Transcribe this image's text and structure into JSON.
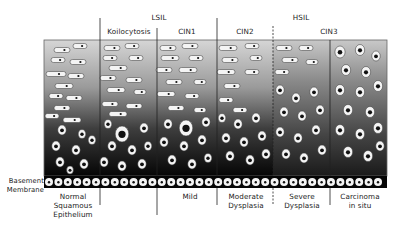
{
  "diagram": {
    "title_groups": {
      "lsil": "LSIL",
      "hsil": "HSIL"
    },
    "top_labels": {
      "koilocytosis": "Koilocytosis",
      "cin1": "CIN1",
      "cin2": "CIN2",
      "cin3": "CIN3"
    },
    "side_label": "Basement\nMembrane",
    "bottom_labels": {
      "normal": "Normal\nSquamous\nEpithelium",
      "mild": "Mild",
      "moderate": "Moderate\nDysplasia",
      "severe": "Severe\nDysplasia",
      "carcinoma": "Carcinoma\nin situ"
    },
    "colors": {
      "gradient_top": "#d4d4d4",
      "gradient_mid": "#6a6a6a",
      "gradient_bottom": "#050505",
      "cell_fill": "#f4f4f4",
      "nucleus": "#111111",
      "divider": "#222222"
    },
    "layout": {
      "box": {
        "x": 44,
        "y": 40,
        "w": 343,
        "h": 136
      },
      "membrane": {
        "y": 176,
        "h": 12
      },
      "dividers": [
        {
          "x": 100,
          "y1": 18,
          "y2": 176,
          "style": "solid",
          "bottom": [
            188,
            205
          ]
        },
        {
          "x": 157,
          "y1": 28,
          "y2": 176,
          "style": "solid",
          "bottom": [
            188,
            215
          ]
        },
        {
          "x": 217,
          "y1": 18,
          "y2": 176,
          "style": "solid",
          "bottom": [
            188,
            205
          ]
        },
        {
          "x": 273,
          "y1": 26,
          "y2": 176,
          "style": "dashed",
          "bottom": [
            188,
            205
          ]
        },
        {
          "x": 330,
          "y1": 40,
          "y2": 176,
          "style": "solid",
          "bottom": [
            188,
            205
          ]
        }
      ]
    },
    "cells": {
      "flat": [
        [
          62,
          50,
          16,
          5
        ],
        [
          80,
          46,
          14,
          5
        ],
        [
          58,
          60,
          14,
          5
        ],
        [
          78,
          62,
          16,
          5
        ],
        [
          56,
          74,
          20,
          5
        ],
        [
          76,
          76,
          16,
          5
        ],
        [
          64,
          86,
          18,
          5
        ],
        [
          56,
          96,
          14,
          5
        ],
        [
          74,
          98,
          16,
          5
        ],
        [
          62,
          108,
          16,
          5
        ],
        [
          52,
          116,
          14,
          5
        ],
        [
          72,
          120,
          18,
          5
        ],
        [
          112,
          48,
          16,
          5
        ],
        [
          132,
          46,
          14,
          5
        ],
        [
          110,
          58,
          14,
          5
        ],
        [
          136,
          58,
          14,
          5
        ],
        [
          118,
          68,
          18,
          5
        ],
        [
          108,
          78,
          16,
          5
        ],
        [
          134,
          80,
          16,
          5
        ],
        [
          116,
          90,
          18,
          5
        ],
        [
          140,
          92,
          12,
          5
        ],
        [
          110,
          104,
          16,
          5
        ],
        [
          134,
          106,
          16,
          5
        ],
        [
          118,
          114,
          18,
          5
        ],
        [
          168,
          48,
          16,
          5
        ],
        [
          190,
          46,
          16,
          5
        ],
        [
          170,
          58,
          18,
          5
        ],
        [
          196,
          58,
          14,
          5
        ],
        [
          164,
          70,
          16,
          5
        ],
        [
          188,
          70,
          18,
          5
        ],
        [
          174,
          82,
          16,
          5
        ],
        [
          200,
          82,
          12,
          5
        ],
        [
          166,
          94,
          18,
          5
        ],
        [
          192,
          96,
          14,
          5
        ],
        [
          176,
          108,
          16,
          5
        ],
        [
          200,
          110,
          12,
          5
        ],
        [
          228,
          48,
          18,
          5
        ],
        [
          252,
          46,
          14,
          5
        ],
        [
          230,
          60,
          16,
          5
        ],
        [
          256,
          58,
          12,
          5
        ],
        [
          226,
          72,
          18,
          5
        ],
        [
          252,
          72,
          14,
          5
        ],
        [
          232,
          86,
          16,
          5
        ],
        [
          226,
          100,
          14,
          5
        ],
        [
          240,
          110,
          14,
          5
        ],
        [
          284,
          48,
          16,
          5
        ],
        [
          306,
          48,
          14,
          5
        ],
        [
          290,
          60,
          16,
          5
        ],
        [
          312,
          62,
          12,
          5
        ],
        [
          282,
          72,
          14,
          5
        ]
      ],
      "round": [
        [
          62,
          130,
          5
        ],
        [
          82,
          134,
          4.5
        ],
        [
          56,
          146,
          5
        ],
        [
          76,
          150,
          5
        ],
        [
          92,
          140,
          4.5
        ],
        [
          60,
          162,
          5
        ],
        [
          84,
          164,
          5
        ],
        [
          70,
          170,
          4
        ],
        [
          108,
          124,
          4.5
        ],
        [
          122,
          134,
          8
        ],
        [
          144,
          128,
          5
        ],
        [
          112,
          146,
          5
        ],
        [
          132,
          150,
          5
        ],
        [
          148,
          146,
          4.5
        ],
        [
          104,
          162,
          5
        ],
        [
          122,
          166,
          5
        ],
        [
          142,
          164,
          5
        ],
        [
          168,
          124,
          5
        ],
        [
          186,
          128,
          8
        ],
        [
          206,
          122,
          5
        ],
        [
          164,
          142,
          5
        ],
        [
          184,
          146,
          5
        ],
        [
          202,
          140,
          5
        ],
        [
          172,
          160,
          5
        ],
        [
          192,
          164,
          5
        ],
        [
          208,
          158,
          4.5
        ],
        [
          222,
          118,
          4.5
        ],
        [
          238,
          124,
          5
        ],
        [
          256,
          118,
          5
        ],
        [
          226,
          138,
          5
        ],
        [
          244,
          142,
          5
        ],
        [
          262,
          136,
          5
        ],
        [
          230,
          156,
          5
        ],
        [
          250,
          160,
          5
        ],
        [
          266,
          154,
          5
        ],
        [
          280,
          90,
          5
        ],
        [
          296,
          98,
          5
        ],
        [
          314,
          92,
          5
        ],
        [
          284,
          112,
          5
        ],
        [
          302,
          116,
          5
        ],
        [
          320,
          110,
          5
        ],
        [
          280,
          132,
          5
        ],
        [
          298,
          138,
          5
        ],
        [
          316,
          130,
          5
        ],
        [
          286,
          154,
          5
        ],
        [
          304,
          158,
          5
        ],
        [
          322,
          150,
          5
        ],
        [
          340,
          52,
          6
        ],
        [
          360,
          50,
          5.5
        ],
        [
          376,
          56,
          5
        ],
        [
          346,
          70,
          5.5
        ],
        [
          366,
          72,
          5.5
        ],
        [
          340,
          90,
          5.5
        ],
        [
          360,
          92,
          5.5
        ],
        [
          378,
          86,
          5.5
        ],
        [
          348,
          110,
          5.5
        ],
        [
          370,
          112,
          5.5
        ],
        [
          340,
          130,
          5.5
        ],
        [
          360,
          134,
          5.5
        ],
        [
          378,
          128,
          5.5
        ],
        [
          348,
          152,
          5.5
        ],
        [
          368,
          156,
          5.5
        ],
        [
          380,
          146,
          5
        ]
      ]
    }
  }
}
